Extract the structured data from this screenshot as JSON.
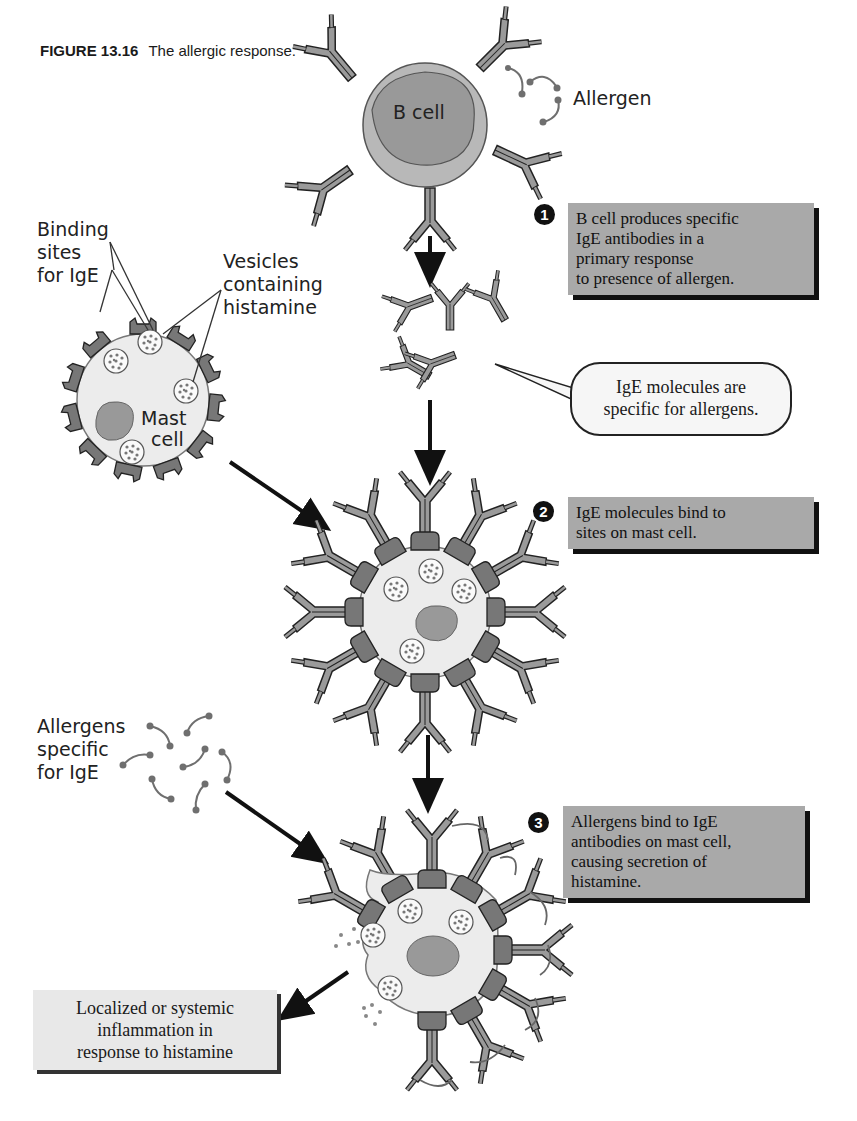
{
  "figure": {
    "number": "FIGURE 13.16",
    "title": "The allergic response."
  },
  "labels": {
    "allergen": "Allergen",
    "b_cell": "B cell",
    "binding_sites": [
      "Binding",
      "sites",
      "for IgE"
    ],
    "vesicles": [
      "Vesicles",
      "containing",
      "histamine"
    ],
    "mast_cell": [
      "Mast",
      "cell"
    ],
    "allergens_specific": [
      "Allergens",
      "specific",
      "for IgE"
    ]
  },
  "steps": [
    {
      "number": "1",
      "lines": [
        "B cell produces specific",
        "IgE antibodies in a",
        "primary response",
        "to presence of allergen."
      ]
    },
    {
      "number": "2",
      "lines": [
        "IgE molecules bind to",
        "sites on mast cell."
      ]
    },
    {
      "number": "3",
      "lines": [
        "Allergens bind to IgE",
        "antibodies on mast cell,",
        "causing secretion of",
        "histamine."
      ]
    }
  ],
  "callout": {
    "lines": [
      "IgE molecules are",
      "specific for allergens."
    ]
  },
  "outcome": {
    "lines": [
      "Localized or systemic",
      "inflammation in",
      "response to histamine"
    ]
  },
  "colors": {
    "step_box": "#a9a9a9",
    "outcome_box": "#e8e8e8",
    "cell_fill": "#ececec",
    "b_cell_outer": "#b8b8b8",
    "nucleus": "#999999",
    "receptor": "#777777",
    "antibody": "#9a9a9a",
    "allergen": "#6f6f6f"
  }
}
